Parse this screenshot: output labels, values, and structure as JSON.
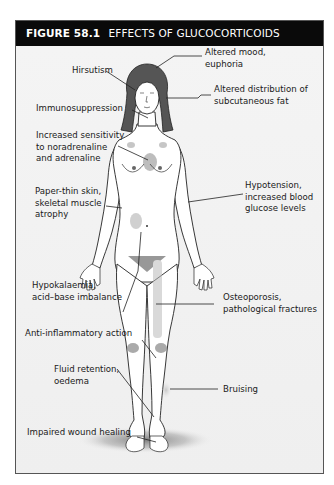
{
  "figure": {
    "number": "FIGURE 58.1",
    "title": "EFFECTS OF GLUCOCORTICOIDS",
    "header_bg": "#0a0a0a",
    "header_fg": "#ffffff",
    "panel_bg": "#f2f2f2"
  },
  "labels": {
    "altered_mood": [
      "Altered mood,",
      "euphoria"
    ],
    "hirsutism": [
      "Hirsutism"
    ],
    "altered_fat": [
      "Altered distribution of",
      "subcutaneous fat"
    ],
    "immunosuppression": [
      "Immunosuppression"
    ],
    "increased_sensitivity": [
      "Increased sensitivity",
      "to noradrenaline",
      "and adrenaline"
    ],
    "hypotension": [
      "Hypotension,",
      "increased blood",
      "glucose levels"
    ],
    "paper_thin_skin": [
      "Paper-thin skin,",
      "skeletal muscle",
      "atrophy"
    ],
    "hypokalaemia": [
      "Hypokalaemia,",
      "acid–base imbalance"
    ],
    "osteoporosis": [
      "Osteoporosis,",
      "pathological fractures"
    ],
    "anti_inflammatory": [
      "Anti-inflammatory action"
    ],
    "fluid_retention": [
      "Fluid retention,",
      "oedema"
    ],
    "bruising": [
      "Bruising"
    ],
    "impaired_wound": [
      "Impaired wound healing"
    ]
  }
}
